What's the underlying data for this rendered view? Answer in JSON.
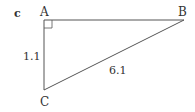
{
  "figure": {
    "panel_label": "c",
    "vertices": {
      "A": {
        "label": "A",
        "x": 44,
        "y": 20
      },
      "B": {
        "label": "B",
        "x": 184,
        "y": 20
      },
      "C": {
        "label": "C",
        "x": 44,
        "y": 90
      }
    },
    "right_angle_at": "A",
    "sides": {
      "AC": {
        "label": "1.1"
      },
      "BC": {
        "label": "6.1"
      }
    },
    "stroke_color": "#555555"
  }
}
